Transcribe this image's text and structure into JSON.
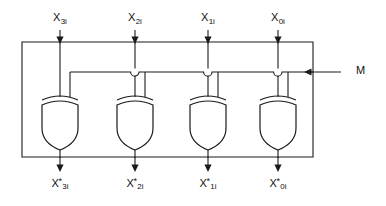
{
  "figure": {
    "background_color": "#ffffff",
    "line_color": "#1a1a1a"
  },
  "inputs": {
    "label_row_y": 22,
    "items": [
      {
        "id": "x3i",
        "base": "X",
        "sub": "3i",
        "x": 60
      },
      {
        "id": "x2i",
        "base": "X",
        "sub": "2i",
        "x": 135
      },
      {
        "id": "x1i",
        "base": "X",
        "sub": "1i",
        "x": 208
      },
      {
        "id": "x0i",
        "base": "X",
        "sub": "0i",
        "x": 278
      }
    ]
  },
  "outputs": {
    "label_row_y": 182,
    "items": [
      {
        "id": "x3i-star",
        "base": "X",
        "star": "*",
        "sub": "3i",
        "x": 60
      },
      {
        "id": "x2i-star",
        "base": "X",
        "star": "*",
        "sub": "2i",
        "x": 135
      },
      {
        "id": "x1i-star",
        "base": "X",
        "star": "*",
        "sub": "1i",
        "x": 208
      },
      {
        "id": "x0i-star",
        "base": "X",
        "star": "*",
        "sub": "0i",
        "x": 278
      }
    ]
  },
  "mode_control": {
    "label": "M",
    "label_x": 358,
    "label_y": 68,
    "bus_y": 72,
    "entry_x": 313
  },
  "gates": [
    {
      "id": "xor-gate-3",
      "type": "XOR",
      "center_x": 60
    },
    {
      "id": "xor-gate-2",
      "type": "XOR",
      "center_x": 135
    },
    {
      "id": "xor-gate-1",
      "type": "XOR",
      "center_x": 208
    },
    {
      "id": "xor-gate-0",
      "type": "XOR",
      "center_x": 278
    }
  ],
  "enclosure": {
    "left": 22,
    "top": 42,
    "right": 313,
    "bottom": 157
  }
}
